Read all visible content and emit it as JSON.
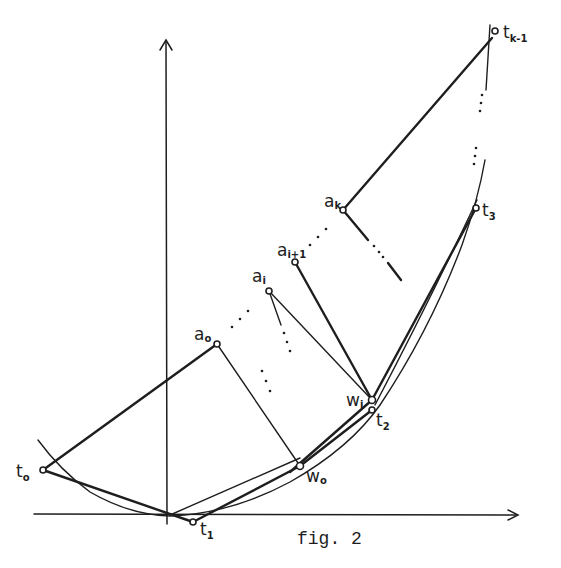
{
  "figure": {
    "caption": "fig. 2",
    "background": "#ffffff",
    "ink": "#1e1e1e"
  },
  "labels": {
    "t0": {
      "base": "t",
      "sub": "o"
    },
    "t1": {
      "base": "t",
      "sub": "1"
    },
    "t2": {
      "base": "t",
      "sub": "2"
    },
    "t3": {
      "base": "t",
      "sub": "3"
    },
    "tk1": {
      "base": "t",
      "sub": "k-1"
    },
    "a0": {
      "base": "a",
      "sub": "o"
    },
    "ai": {
      "base": "a",
      "sub": "i"
    },
    "ai1": {
      "base": "a",
      "sub": "i+1"
    },
    "ak": {
      "base": "a",
      "sub": "k"
    },
    "w0": {
      "base": "w",
      "sub": "o"
    },
    "wi": {
      "base": "w",
      "sub": "i"
    }
  },
  "points": {
    "t0": [
      43,
      470
    ],
    "t1": [
      193,
      522
    ],
    "t2": [
      372,
      410
    ],
    "t3": [
      476,
      208
    ],
    "tk1": [
      493,
      32
    ],
    "a0": [
      217,
      344
    ],
    "ai": [
      269,
      291
    ],
    "ai1": [
      295,
      262
    ],
    "ak": [
      343,
      210
    ],
    "w0": [
      300,
      466
    ],
    "wi": [
      372,
      400
    ],
    "origin": [
      167,
      515
    ]
  }
}
